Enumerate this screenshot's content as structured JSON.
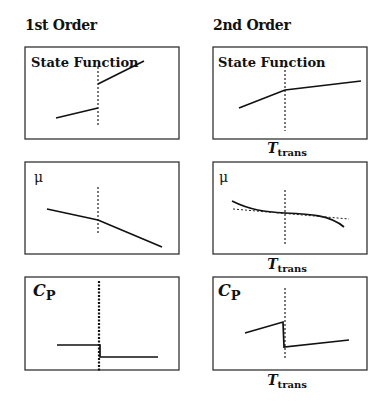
{
  "columns": [
    {
      "heading": "1st Order"
    },
    {
      "heading": "2nd Order"
    }
  ],
  "panels": {
    "first_state_function": {
      "label": "State Function"
    },
    "second_state_function": {
      "label": "State Function"
    },
    "first_mu": {
      "label": "μ"
    },
    "second_mu": {
      "label": "μ"
    },
    "first_cp": {
      "label_main": "C",
      "label_sub": "P"
    },
    "second_cp": {
      "label_main": "C",
      "label_sub": "P"
    }
  },
  "axis_label": {
    "main": "T",
    "sub": "trans"
  },
  "colors": {
    "line": "#111111",
    "frame": "#333333",
    "background": "#ffffff"
  }
}
